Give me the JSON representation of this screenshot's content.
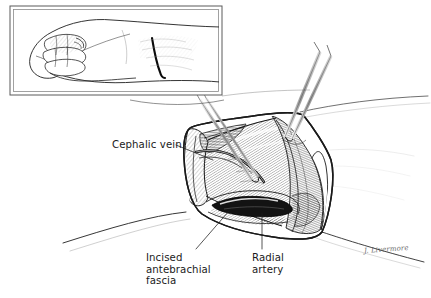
{
  "figure": {
    "kind": "medical-surgical-illustration",
    "background_color": "#ffffff",
    "ink_color": "#1b1b1b",
    "width": 431,
    "height": 298
  },
  "inset": {
    "name": "orientation-inset",
    "description": "Lateral view of a clenched fist and forearm showing the planned skin incision over the distal radial forearm",
    "frame": {
      "x": 10,
      "y": 6,
      "width": 212,
      "height": 89,
      "style": "double-rule"
    }
  },
  "labels": [
    {
      "id": "cephalic-vein",
      "text": "Cephalic vein",
      "x": 112,
      "y": 139,
      "leader": {
        "from": [
          176,
          145
        ],
        "to": [
          213,
          160
        ]
      }
    },
    {
      "id": "incised-antebrachial-fascia",
      "text": "Incised\nantebrachial\nfascia",
      "x": 146,
      "y": 252,
      "leader": {
        "from": [
          196,
          250
        ],
        "to": [
          228,
          212
        ]
      }
    },
    {
      "id": "radial-artery",
      "text": "Radial\nartery",
      "x": 252,
      "y": 252,
      "leader": {
        "from": [
          262,
          250
        ],
        "to": [
          262,
          214
        ]
      }
    }
  ],
  "signature": {
    "text": "J. Livermore",
    "x": 364,
    "y": 247
  },
  "instruments": [
    {
      "id": "upper-right-forceps",
      "type": "forceps",
      "entry": "upper-right"
    },
    {
      "id": "left-dissector",
      "type": "dissector",
      "entry": "upper-left-of-wound"
    }
  ],
  "anatomy": [
    {
      "id": "cephalic-vein",
      "name": "Cephalic vein"
    },
    {
      "id": "antebrachial-fascia",
      "name": "Incised antebrachial fascia"
    },
    {
      "id": "radial-artery",
      "name": "Radial artery"
    },
    {
      "id": "forearm-skin",
      "name": "Forearm skin contour"
    }
  ]
}
